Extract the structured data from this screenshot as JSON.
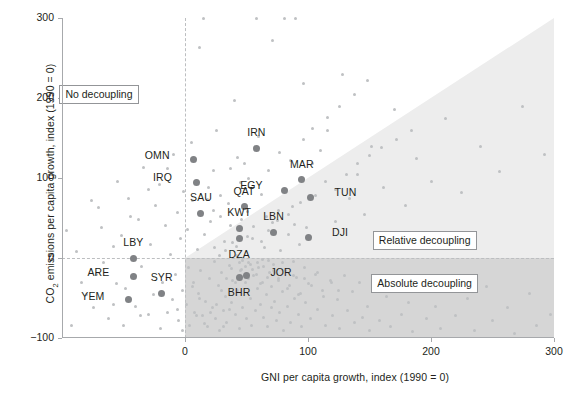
{
  "chart_data": {
    "type": "scatter",
    "title": "",
    "xlabel": "GNI per capita growth, index (1990 = 0)",
    "ylabel_html": "CO<sub>2</sub> emissions per capita growth, index (1990 = 0)",
    "ylabel_text": "CO2 emissions per capita growth, index (1990 = 0)",
    "xlim": [
      -100,
      300
    ],
    "ylim": [
      -100,
      300
    ],
    "xticks": [
      0,
      100,
      200,
      300
    ],
    "xticklabels": [
      "0",
      "100",
      "200",
      "300"
    ],
    "yticks": [
      -100,
      0,
      100,
      200,
      300
    ],
    "yticklabels": [
      "-100",
      "0",
      "100",
      "200",
      "300"
    ],
    "grid": false,
    "legend_position": "in-plot annotation boxes",
    "colors": {
      "point_background": "#bfc1c3",
      "point_highlight": "#808285",
      "region_relative_decoupling": "#ededed",
      "region_absolute_decoupling": "#d6d6d6",
      "axis": "#a7a9ac",
      "text": "#231f20",
      "zero_line": "#bcbec0"
    },
    "annotations": [
      {
        "name": "no-decoupling",
        "label": "No decoupling",
        "x": -70,
        "y": 205
      },
      {
        "name": "relative-decoupling",
        "label": "Relative decoupling",
        "x": 195,
        "y": 22
      },
      {
        "name": "absolute-decoupling",
        "label": "Absolute decoupling",
        "x": 195,
        "y": -32
      }
    ],
    "regions": [
      {
        "name": "relative-decoupling-band",
        "shape": "triangle",
        "vertices": [
          [
            0,
            0
          ],
          [
            300,
            0
          ],
          [
            300,
            300
          ]
        ],
        "fill": "#ededed"
      },
      {
        "name": "absolute-decoupling-band",
        "shape": "rect",
        "x0": 0,
        "y0": -100,
        "x1": 300,
        "y1": 0,
        "fill": "#d6d6d6"
      }
    ],
    "highlighted_points": [
      {
        "code": "OMN",
        "x": 7,
        "y": 123,
        "label_dx": -24,
        "label_dy": -4,
        "anchor": "right"
      },
      {
        "code": "IRN",
        "x": 58,
        "y": 137,
        "label_dx": 0,
        "label_dy": -15,
        "anchor": "center"
      },
      {
        "code": "MAR",
        "x": 95,
        "y": 98,
        "label_dx": 0,
        "label_dy": -15,
        "anchor": "center"
      },
      {
        "code": "IRQ",
        "x": 9,
        "y": 95,
        "label_dx": -24,
        "label_dy": -4,
        "anchor": "right"
      },
      {
        "code": "EGY",
        "x": 81,
        "y": 85,
        "label_dx": -22,
        "label_dy": -4,
        "anchor": "right"
      },
      {
        "code": "TUN",
        "x": 102,
        "y": 76,
        "label_dx": 24,
        "label_dy": -4,
        "anchor": "left"
      },
      {
        "code": "QAT",
        "x": 48,
        "y": 64,
        "label_dx": 0,
        "label_dy": -15,
        "anchor": "center"
      },
      {
        "code": "SAU",
        "x": 13,
        "y": 56,
        "label_dx": 0,
        "label_dy": -15,
        "anchor": "center"
      },
      {
        "code": "KWT",
        "x": 44,
        "y": 37,
        "label_dx": 0,
        "label_dy": -15,
        "anchor": "center"
      },
      {
        "code": "LBN",
        "x": 72,
        "y": 32,
        "label_dx": 0,
        "label_dy": -15,
        "anchor": "center"
      },
      {
        "code": "DJI",
        "x": 100,
        "y": 26,
        "label_dx": 24,
        "label_dy": -4,
        "anchor": "left"
      },
      {
        "code": "DZA",
        "x": 44,
        "y": 24,
        "label_dx": 0,
        "label_dy": 16,
        "anchor": "center"
      },
      {
        "code": "LBY",
        "x": -42,
        "y": 0,
        "label_dx": 0,
        "label_dy": -15,
        "anchor": "center"
      },
      {
        "code": "JOR",
        "x": 50,
        "y": -22,
        "label_dx": 24,
        "label_dy": -3,
        "anchor": "left"
      },
      {
        "code": "BHR",
        "x": 44,
        "y": -24,
        "label_dx": 0,
        "label_dy": 16,
        "anchor": "center"
      },
      {
        "code": "ARE",
        "x": -42,
        "y": -23,
        "label_dx": -24,
        "label_dy": -3,
        "anchor": "right"
      },
      {
        "code": "SYR",
        "x": -19,
        "y": -44,
        "label_dx": 0,
        "label_dy": -15,
        "anchor": "center"
      },
      {
        "code": "YEM",
        "x": -46,
        "y": -52,
        "label_dx": -24,
        "label_dy": -3,
        "anchor": "right"
      }
    ],
    "background_points": [
      [
        -92,
        -84
      ],
      [
        -74,
        -62
      ],
      [
        -72,
        -20
      ],
      [
        -70,
        63
      ],
      [
        -62,
        -76
      ],
      [
        -58,
        14
      ],
      [
        -56,
        -32
      ],
      [
        -55,
        96
      ],
      [
        -52,
        28
      ],
      [
        -48,
        -38
      ],
      [
        -46,
        75
      ],
      [
        -40,
        -61
      ],
      [
        -38,
        48
      ],
      [
        -35,
        -10
      ],
      [
        -34,
        113
      ],
      [
        -30,
        -70
      ],
      [
        -28,
        17
      ],
      [
        -26,
        -46
      ],
      [
        -24,
        66
      ],
      [
        -21,
        92
      ],
      [
        -18,
        -30
      ],
      [
        -16,
        41
      ],
      [
        -14,
        -68
      ],
      [
        -12,
        4
      ],
      [
        -10,
        -52
      ],
      [
        -9,
        130
      ],
      [
        -8,
        -20
      ],
      [
        -6,
        57
      ],
      [
        -5,
        -78
      ],
      [
        -4,
        24
      ],
      [
        -2,
        -40
      ],
      [
        -1,
        83
      ],
      [
        1,
        -58
      ],
      [
        2,
        36
      ],
      [
        3,
        -12
      ],
      [
        4,
        -84
      ],
      [
        5,
        145
      ],
      [
        6,
        72
      ],
      [
        7,
        -30
      ],
      [
        8,
        -68
      ],
      [
        10,
        11
      ],
      [
        11,
        -44
      ],
      [
        12,
        263
      ],
      [
        13,
        -16
      ],
      [
        14,
        -72
      ],
      [
        15,
        300
      ],
      [
        16,
        30
      ],
      [
        17,
        -54
      ],
      [
        18,
        -86
      ],
      [
        19,
        88
      ],
      [
        20,
        -25
      ],
      [
        21,
        46
      ],
      [
        22,
        -62
      ],
      [
        23,
        109
      ],
      [
        24,
        -4
      ],
      [
        25,
        -75
      ],
      [
        26,
        160
      ],
      [
        27,
        -34
      ],
      [
        28,
        -90
      ],
      [
        29,
        52
      ],
      [
        30,
        -18
      ],
      [
        31,
        -66
      ],
      [
        32,
        21
      ],
      [
        33,
        -48
      ],
      [
        34,
        -80
      ],
      [
        35,
        68
      ],
      [
        36,
        -9
      ],
      [
        37,
        41
      ],
      [
        38,
        -56
      ],
      [
        39,
        -28
      ],
      [
        40,
        197
      ],
      [
        41,
        -70
      ],
      [
        42,
        3
      ],
      [
        43,
        -40
      ],
      [
        44,
        -88
      ],
      [
        45,
        95
      ],
      [
        46,
        -14
      ],
      [
        47,
        -62
      ],
      [
        48,
        118
      ],
      [
        49,
        -30
      ],
      [
        50,
        -76
      ],
      [
        51,
        58
      ],
      [
        52,
        -6
      ],
      [
        53,
        -50
      ],
      [
        54,
        -84
      ],
      [
        55,
        25
      ],
      [
        56,
        -22
      ],
      [
        57,
        -66
      ],
      [
        58,
        300
      ],
      [
        59,
        -38
      ],
      [
        60,
        -12
      ],
      [
        61,
        -58
      ],
      [
        62,
        80
      ],
      [
        63,
        -30
      ],
      [
        64,
        -74
      ],
      [
        65,
        13
      ],
      [
        66,
        -46
      ],
      [
        67,
        -86
      ],
      [
        68,
        34
      ],
      [
        69,
        -18
      ],
      [
        70,
        -62
      ],
      [
        71,
        272
      ],
      [
        72,
        -8
      ],
      [
        73,
        -54
      ],
      [
        74,
        -78
      ],
      [
        75,
        47
      ],
      [
        76,
        -26
      ],
      [
        77,
        -68
      ],
      [
        78,
        9
      ],
      [
        79,
        -42
      ],
      [
        80,
        -90
      ],
      [
        81,
        300
      ],
      [
        82,
        -16
      ],
      [
        83,
        -60
      ],
      [
        84,
        29
      ],
      [
        85,
        -34
      ],
      [
        86,
        -80
      ],
      [
        87,
        65
      ],
      [
        88,
        -4
      ],
      [
        89,
        -50
      ],
      [
        90,
        300
      ],
      [
        91,
        -24
      ],
      [
        92,
        -70
      ],
      [
        93,
        17
      ],
      [
        94,
        -44
      ],
      [
        95,
        -86
      ],
      [
        96,
        218
      ],
      [
        97,
        -12
      ],
      [
        98,
        -56
      ],
      [
        99,
        38
      ],
      [
        100,
        -32
      ],
      [
        102,
        -76
      ],
      [
        104,
        118
      ],
      [
        106,
        -20
      ],
      [
        108,
        -64
      ],
      [
        110,
        135
      ],
      [
        112,
        -40
      ],
      [
        114,
        -84
      ],
      [
        116,
        160
      ],
      [
        118,
        -28
      ],
      [
        120,
        -72
      ],
      [
        122,
        46
      ],
      [
        124,
        -52
      ],
      [
        126,
        -88
      ],
      [
        128,
        230
      ],
      [
        130,
        -22
      ],
      [
        132,
        -66
      ],
      [
        134,
        74
      ],
      [
        136,
        -42
      ],
      [
        138,
        -80
      ],
      [
        140,
        105
      ],
      [
        142,
        -30
      ],
      [
        144,
        -74
      ],
      [
        146,
        55
      ],
      [
        148,
        -60
      ],
      [
        150,
        -90
      ],
      [
        152,
        140
      ],
      [
        155,
        -36
      ],
      [
        158,
        -78
      ],
      [
        161,
        88
      ],
      [
        164,
        -48
      ],
      [
        167,
        -86
      ],
      [
        170,
        186
      ],
      [
        173,
        -26
      ],
      [
        176,
        -70
      ],
      [
        179,
        66
      ],
      [
        182,
        -55
      ],
      [
        185,
        -92
      ],
      [
        188,
        125
      ],
      [
        192,
        -34
      ],
      [
        196,
        -76
      ],
      [
        200,
        96
      ],
      [
        204,
        -60
      ],
      [
        208,
        -88
      ],
      [
        212,
        175
      ],
      [
        216,
        -28
      ],
      [
        220,
        -72
      ],
      [
        225,
        82
      ],
      [
        230,
        -50
      ],
      [
        235,
        -90
      ],
      [
        240,
        140
      ],
      [
        245,
        -36
      ],
      [
        250,
        -78
      ],
      [
        256,
        108
      ],
      [
        262,
        -62
      ],
      [
        268,
        -94
      ],
      [
        274,
        190
      ],
      [
        280,
        -44
      ],
      [
        286,
        -84
      ],
      [
        292,
        130
      ],
      [
        297,
        -70
      ],
      [
        6,
        -36
      ],
      [
        9,
        -72
      ],
      [
        12,
        -50
      ],
      [
        16,
        -82
      ],
      [
        21,
        -68
      ],
      [
        26,
        -58
      ],
      [
        31,
        -86
      ],
      [
        36,
        -64
      ],
      [
        41,
        -30
      ],
      [
        45,
        -16
      ],
      [
        49,
        -10
      ],
      [
        52,
        -26
      ],
      [
        55,
        -14
      ],
      [
        58,
        -20
      ],
      [
        61,
        -32
      ],
      [
        64,
        -11
      ],
      [
        67,
        -24
      ],
      [
        70,
        -36
      ],
      [
        73,
        -18
      ],
      [
        76,
        -28
      ],
      [
        79,
        -6
      ],
      [
        38,
        -13
      ],
      [
        34,
        -25
      ],
      [
        30,
        -40
      ],
      [
        44,
        -6
      ],
      [
        47,
        -3
      ],
      [
        53,
        -8
      ],
      [
        59,
        -5
      ],
      [
        63,
        -2
      ],
      [
        68,
        -3
      ],
      [
        72,
        -15
      ],
      [
        83,
        -38
      ],
      [
        88,
        -22
      ],
      [
        92,
        -46
      ],
      [
        97,
        -26
      ],
      [
        103,
        -34
      ],
      [
        108,
        -18
      ],
      [
        113,
        -48
      ],
      [
        119,
        -30
      ],
      [
        125,
        -40
      ],
      [
        24,
        13
      ],
      [
        28,
        3
      ],
      [
        33,
        9
      ],
      [
        39,
        19
      ],
      [
        42,
        15
      ],
      [
        46,
        48
      ],
      [
        51,
        27
      ],
      [
        56,
        39
      ],
      [
        62,
        21
      ],
      [
        66,
        52
      ],
      [
        71,
        44
      ],
      [
        76,
        60
      ],
      [
        84,
        55
      ],
      [
        89,
        42
      ],
      [
        94,
        70
      ],
      [
        106,
        78
      ],
      [
        114,
        96
      ],
      [
        122,
        86
      ],
      [
        131,
        105
      ],
      [
        140,
        118
      ],
      [
        150,
        128
      ],
      [
        160,
        138
      ],
      [
        172,
        148
      ],
      [
        184,
        160
      ],
      [
        18,
        73
      ],
      [
        23,
        60
      ],
      [
        29,
        78
      ],
      [
        37,
        112
      ],
      [
        43,
        126
      ],
      [
        52,
        100
      ],
      [
        60,
        152
      ],
      [
        68,
        110
      ],
      [
        77,
        132
      ],
      [
        86,
        122
      ],
      [
        96,
        148
      ],
      [
        104,
        162
      ],
      [
        116,
        176
      ],
      [
        126,
        190
      ],
      [
        138,
        205
      ],
      [
        148,
        222
      ],
      [
        -96,
        35
      ],
      [
        -88,
        8
      ],
      [
        -80,
        -45
      ],
      [
        -66,
        -5
      ],
      [
        -50,
        -84
      ],
      [
        -44,
        52
      ],
      [
        -36,
        -72
      ],
      [
        -20,
        -88
      ],
      [
        -14,
        112
      ],
      [
        -6,
        -64
      ],
      [
        -2,
        -90
      ],
      [
        -30,
        86
      ],
      [
        -58,
        -58
      ],
      [
        -68,
        38
      ],
      [
        -76,
        72
      ],
      [
        -84,
        -30
      ]
    ]
  }
}
